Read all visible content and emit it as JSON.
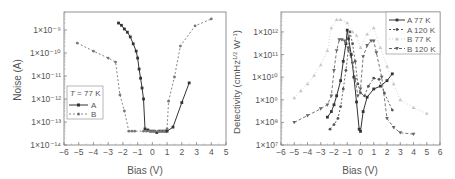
{
  "chart_data": [
    {
      "type": "line",
      "title": "",
      "xlabel": "Bias (V)",
      "ylabel": "Noise (A)",
      "yscale": "log",
      "xlim": [
        -6,
        5
      ],
      "ylim": [
        1e-14,
        6e-09
      ],
      "xticks": [
        "-6",
        "-5",
        "-4",
        "-3",
        "-2",
        "-1",
        "0",
        "1",
        "2",
        "3",
        "4",
        "5"
      ],
      "yticks": [
        "1×10⁻¹⁴",
        "1×10⁻¹³",
        "1×10⁻¹²",
        "1×10⁻¹¹",
        "1×10⁻¹⁰",
        "1×10⁻⁹"
      ],
      "legend_title": "T = 77 K",
      "legend_position": "left-middle",
      "grid": false,
      "series": [
        {
          "name": "A",
          "style": "solid",
          "marker": "square",
          "x": [
            -2.3,
            -2.1,
            -1.9,
            -1.7,
            -1.5,
            -1.3,
            -1.1,
            -1.0,
            -0.9,
            -0.8,
            -0.7,
            -0.6,
            -0.5,
            -0.3,
            -0.1,
            0.1,
            0.3,
            0.5,
            0.7,
            0.9,
            1.0,
            1.4,
            2.0,
            2.5
          ],
          "y": [
            2e-09,
            1.6e-09,
            1.1e-09,
            8e-10,
            5e-10,
            2.5e-10,
            1.2e-10,
            6e-11,
            2e-11,
            8e-12,
            3e-12,
            1e-12,
            5e-14,
            4.5e-14,
            4e-14,
            4e-14,
            3.5e-14,
            4e-14,
            4e-14,
            4e-14,
            4e-14,
            6e-14,
            7e-13,
            5e-12
          ]
        },
        {
          "name": "B",
          "style": "dashed",
          "marker": "circle",
          "x": [
            -5.1,
            -4.0,
            -3.0,
            -2.5,
            -2.2,
            -1.9,
            -1.6,
            -1.4,
            -1.2,
            -0.6,
            -0.4,
            -0.2,
            0.0,
            0.2,
            0.4,
            0.6,
            0.8,
            1.0,
            1.1,
            1.5,
            1.9,
            2.9,
            4.0
          ],
          "y": [
            2.7e-10,
            1.2e-10,
            6e-11,
            4e-11,
            1.5e-12,
            3e-13,
            4e-14,
            4e-14,
            4e-14,
            4e-14,
            4e-14,
            4e-14,
            4e-14,
            4e-14,
            4e-14,
            4e-14,
            4e-14,
            5e-14,
            8e-13,
            9e-12,
            2e-10,
            1.5e-09,
            3e-09
          ]
        }
      ]
    },
    {
      "type": "line",
      "title": "",
      "xlabel": "Bias (V)",
      "ylabel": "Detectivity (cmHz1/2 W-1)",
      "yscale": "log",
      "xlim": [
        -6,
        6
      ],
      "ylim": [
        10000000.0,
        8000000000000.0
      ],
      "xticks": [
        "-6",
        "-5",
        "-4",
        "-3",
        "-2",
        "-1",
        "0",
        "1",
        "2",
        "3",
        "4",
        "5",
        "6"
      ],
      "yticks": [
        "1×10⁷",
        "1×10⁸",
        "1×10⁹",
        "1×10¹⁰",
        "1×10¹¹",
        "1×10¹²"
      ],
      "legend_position": "upper-right",
      "grid": false,
      "series": [
        {
          "name": "A 77 K",
          "style": "solid",
          "marker": "square",
          "x": [
            -2.5,
            -2.2,
            -2.0,
            -1.8,
            -1.5,
            -1.3,
            -1.1,
            -1.0,
            -0.9,
            -0.7,
            -0.5,
            -0.3,
            -0.1,
            0.0,
            0.2,
            0.5,
            1.0,
            1.5,
            2.0,
            2.4
          ],
          "y": [
            170000000.0,
            300000000.0,
            600000000.0,
            1500000000.0,
            7000000000.0,
            50000000000.0,
            300000000000.0,
            1200000000000.0,
            500000000000.0,
            100000000000.0,
            10000000000.0,
            800000000.0,
            50000000.0,
            40000000.0,
            300000000.0,
            1300000000.0,
            3000000000.0,
            4000000000.0,
            7000000000.0,
            14000000000.0
          ]
        },
        {
          "name": "A 120 K",
          "style": "dashed",
          "marker": "circle",
          "x": [
            -2.3,
            -2.0,
            -1.7,
            -1.5,
            -1.3,
            -1.1,
            -0.9,
            -0.8,
            -0.6,
            -0.4,
            -0.2,
            0.0,
            0.3,
            0.6,
            1.0,
            1.4,
            1.8,
            2.4
          ],
          "y": [
            50000000.0,
            80000000.0,
            150000000.0,
            500000000.0,
            3000000000.0,
            20000000000.0,
            200000000000.0,
            1000000000000.0,
            300000000000.0,
            50000000000.0,
            5000000000.0,
            2000000000.0,
            1500000000.0,
            4000000000.0,
            9000000000.0,
            8000000000.0,
            2000000000.0,
            350000000.0
          ]
        },
        {
          "name": "B 77 K",
          "style": "dotted",
          "marker": "triangle-up",
          "x": [
            -5.0,
            -4.5,
            -4.0,
            -3.5,
            -3.0,
            -2.5,
            -2.2,
            -1.8,
            -1.5,
            -1.0,
            -0.6,
            -0.3,
            0.0,
            0.5,
            1.0,
            1.5,
            2.0,
            2.5,
            3.0,
            4.0,
            5.0
          ],
          "y": [
            1200000000.0,
            2500000000.0,
            5000000000.0,
            12000000000.0,
            35000000000.0,
            150000000000.0,
            1500000000000.0,
            3500000000000.0,
            3500000000000.0,
            2500000000000.0,
            1000000000000.0,
            700000000000.0,
            200000000000.0,
            800000000000.0,
            1500000000000.0,
            200000000000.0,
            30000000000.0,
            5000000000.0,
            1000000000.0,
            450000000.0,
            250000000.0
          ]
        },
        {
          "name": "B 120 K",
          "style": "dashed",
          "marker": "triangle-down",
          "x": [
            -5.0,
            -4.0,
            -3.0,
            -2.5,
            -2.2,
            -2.0,
            -1.8,
            -1.6,
            -1.4,
            -1.2,
            -0.9,
            -0.6,
            -0.4,
            -0.2,
            0.0,
            0.2,
            0.5,
            0.8,
            1.0,
            1.2,
            1.6,
            2.0,
            2.5,
            3.0,
            4.0
          ],
          "y": [
            100000000.0,
            200000000.0,
            400000000.0,
            600000000.0,
            1500000000.0,
            20000000000.0,
            150000000000.0,
            450000000000.0,
            450000000000.0,
            400000000000.0,
            150000000000.0,
            40000000000.0,
            8000000000.0,
            1500000000.0,
            3000000000.0,
            80000000000.0,
            250000000000.0,
            400000000000.0,
            400000000000.0,
            120000000000.0,
            10000000000.0,
            150000000.0,
            60000000.0,
            35000000.0,
            30000000.0
          ]
        }
      ]
    }
  ],
  "panels": {
    "left": {
      "ylabel": "Noise (A)",
      "xlabel": "Bias (V)",
      "legend_title": "T = 77 K",
      "legend_items": [
        "A",
        "B"
      ]
    },
    "right": {
      "ylabel": "Detectivity (cmHz",
      "ylabel_sup1": "1/2",
      "ylabel_mid": " W",
      "ylabel_sup2": "−1",
      "ylabel_end": ")",
      "xlabel": "Bias (V)",
      "legend_items": [
        "A 77 K",
        "A 120 K",
        "B 77 K",
        "B 120 K"
      ]
    }
  },
  "colors": {
    "A": "#333333",
    "B": "#777777",
    "A77": "#333333",
    "A120": "#555555",
    "B77": "#c8c8c8",
    "B120": "#666666",
    "frame": "#555555"
  }
}
